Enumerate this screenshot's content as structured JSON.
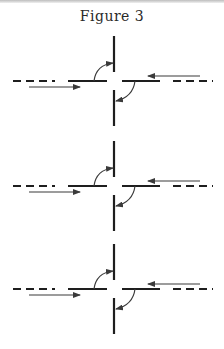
{
  "figure": {
    "title": "Figure 3",
    "ink_color": "#1e1e1e",
    "arrow_color": "#3a3a3a",
    "panels": [
      {
        "id": 1,
        "center_y": 81,
        "top_y1": 36,
        "bottom_y2": 126
      },
      {
        "id": 2,
        "center_y": 186,
        "top_y1": 141,
        "bottom_y2": 231
      },
      {
        "id": 3,
        "center_y": 289,
        "top_y1": 244,
        "bottom_y2": 334
      }
    ],
    "elements_per_panel": [
      "dashed-line-left",
      "solid-segment-left",
      "solid-segment-right",
      "dashed-line-right",
      "vertical-line-top",
      "vertical-line-bottom",
      "straight-arrow-rightward-below-left",
      "straight-arrow-leftward-above-right",
      "curved-arrow-up-left-quadrant",
      "curved-arrow-down-right-quadrant"
    ]
  }
}
